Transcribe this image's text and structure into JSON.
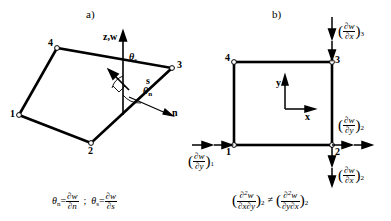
{
  "figure": {
    "panels": [
      {
        "tag": "a)",
        "description": "Quadrilateral plate element in 3D with normal and tangential rotation directions at node 3",
        "nodes": [
          {
            "label": "1",
            "x": 19,
            "y": 115
          },
          {
            "label": "2",
            "x": 91,
            "y": 143
          },
          {
            "label": "3",
            "x": 172,
            "y": 68
          },
          {
            "label": "4",
            "x": 57,
            "y": 48
          }
        ],
        "axis_label": "z,w",
        "direction_labels": [
          "s",
          "n"
        ],
        "angle_labels": [
          "θ",
          "θ"
        ],
        "angle_subscripts": [
          "s",
          "n"
        ],
        "equation": {
          "theta_n": "θ",
          "theta_n_sub": "n",
          "eq1_num": "∂w",
          "eq1_den": "∂n",
          "separator": ";",
          "theta_s": "θ",
          "theta_s_sub": "s",
          "eq2_num": "∂w",
          "eq2_den": "∂s",
          "equals": "="
        }
      },
      {
        "tag": "b)",
        "description": "Planar rectangular element with x-y axes showing non-commuting mixed derivatives at node 2",
        "nodes": [
          {
            "label": "1",
            "x": 234,
            "y": 145
          },
          {
            "label": "2",
            "x": 332,
            "y": 145
          },
          {
            "label": "3",
            "x": 332,
            "y": 62
          },
          {
            "label": "4",
            "x": 234,
            "y": 62
          }
        ],
        "axis_x": "x",
        "axis_y": "y",
        "arrow_labels": [
          {
            "name": "dw-dx-3",
            "num": "∂w",
            "den": "∂x",
            "sub": "3"
          },
          {
            "name": "dw-dy-1",
            "num": "∂w",
            "den": "∂y",
            "sub": "1"
          },
          {
            "name": "dw-dy-2",
            "num": "∂w",
            "den": "∂y",
            "sub": "2"
          },
          {
            "name": "dw-dx-2",
            "num": "∂w",
            "den": "∂x",
            "sub": "2"
          }
        ],
        "equation": {
          "lhs_num_base": "∂",
          "lhs_num_sup": "2",
          "lhs_num_w": "w",
          "lhs_den": "∂x∂y",
          "lhs_sub": "2",
          "relation": "≠",
          "rhs_num_base": "∂",
          "rhs_num_sup": "2",
          "rhs_num_w": "w",
          "rhs_den": "∂y∂x",
          "rhs_sub": "2"
        }
      }
    ],
    "colors": {
      "ink": "#000000",
      "background": "#ffffff"
    }
  }
}
